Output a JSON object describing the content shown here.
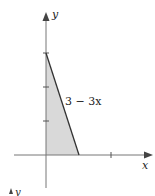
{
  "diagram": {
    "type": "region-under-line",
    "axes": {
      "x_label": "x",
      "y_label": "y"
    },
    "curve_label": "3 − 3x",
    "region": {
      "vertices": [
        [
          0,
          0
        ],
        [
          0,
          3
        ],
        [
          1,
          0
        ]
      ],
      "fill": "#d9d9d9"
    },
    "y_ticks": [
      1,
      2,
      3
    ],
    "x_ticks": [
      1,
      2
    ],
    "line_color": "#333333",
    "partial_next_figure_label": "y"
  }
}
